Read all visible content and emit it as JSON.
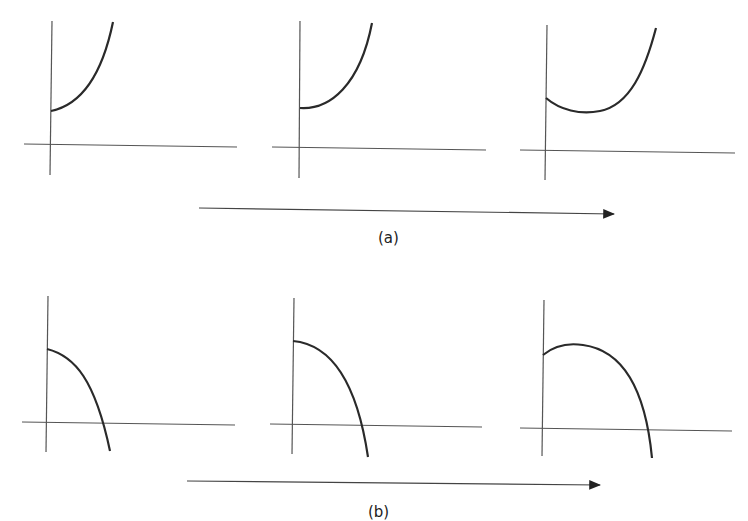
{
  "figure": {
    "stroke_color": "#2a2a2a",
    "axis_color": "#555555",
    "row_a": {
      "caption": "(a)",
      "description": "Sequence of three convex increasing curves; third dips to a minimum before rising",
      "panels": [
        {
          "name": "a1",
          "shape": "increasing-convex"
        },
        {
          "name": "a2",
          "shape": "increasing-convex-flat-start"
        },
        {
          "name": "a3",
          "shape": "decrease-then-increase"
        }
      ]
    },
    "row_b": {
      "caption": "(b)",
      "description": "Sequence of three concave decreasing curves crossing the x-axis; third rises to a maximum before falling",
      "panels": [
        {
          "name": "b1",
          "shape": "decreasing-concave"
        },
        {
          "name": "b2",
          "shape": "decreasing-concave-flat-start"
        },
        {
          "name": "b3",
          "shape": "increase-then-decrease"
        }
      ]
    },
    "arrow_direction": "right"
  }
}
